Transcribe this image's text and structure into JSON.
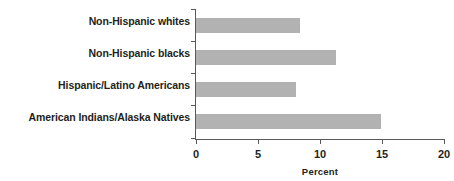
{
  "chart_data": {
    "type": "bar",
    "orientation": "horizontal",
    "title": "",
    "xlabel": "Percent",
    "ylabel": "",
    "categories": [
      "Non-Hispanic whites",
      "Non-Hispanic blacks",
      "Hispanic/Latino Americans",
      "American Indians/Alaska Natives"
    ],
    "values": [
      8.4,
      11.3,
      8.1,
      14.9
    ],
    "xlim": [
      0,
      20
    ],
    "xticks": [
      0,
      5,
      10,
      15,
      20
    ],
    "xtick_labels": [
      "0",
      "5",
      "10",
      "15",
      "20"
    ],
    "grid": false,
    "legend": null,
    "bar_color": "#b2b2b2",
    "axis_color": "#58595b",
    "text_color": "#231f20",
    "background": "#ffffff"
  }
}
